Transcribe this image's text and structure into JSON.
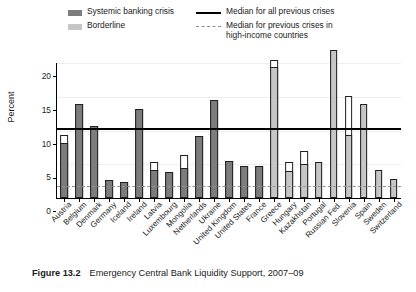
{
  "legend": {
    "systemic": {
      "label": "Systemic banking crisis",
      "color": "#7c7c7c",
      "icon": "legend-swatch"
    },
    "borderline": {
      "label": "Borderline",
      "color": "#c6c6c6",
      "icon": "legend-swatch"
    },
    "median_all": {
      "label": "Median for all previous crises",
      "color": "#000000",
      "icon": "legend-solid-line"
    },
    "median_high_income": {
      "label": "Median for previous crises in\nhigh-income countries",
      "color": "#949494",
      "icon": "legend-dashed-line"
    }
  },
  "caption": {
    "figure_number": "Figure 13.2",
    "title": "Emergency Central Bank Liquidity Support, 2007–09"
  },
  "chart_data": {
    "type": "bar",
    "title": "Emergency Central Bank Liquidity Support, 2007–09",
    "xlabel": "",
    "ylabel": "Percent",
    "ylim": [
      0,
      20
    ],
    "yticks": [
      0,
      5,
      10,
      15,
      20
    ],
    "ytick_labels": [
      "0",
      "5",
      "10",
      "15",
      "20"
    ],
    "grid": true,
    "legend_position": "top",
    "categories": [
      "Austria",
      "Belgium",
      "Denmark",
      "Germany",
      "Iceland",
      "Ireland",
      "Latvia",
      "Luxembourg",
      "Mongolia",
      "Netherlands",
      "Ukraine",
      "United Kingdom",
      "United States",
      "France",
      "Greece",
      "Hungary",
      "Kazakhstan",
      "Portugal",
      "Russian Fed.",
      "Slovenia",
      "Spain",
      "Sweden",
      "Switzerland"
    ],
    "series": [
      {
        "name": "Systemic banking crisis",
        "color": "#7c7c7c",
        "values": [
          8.2,
          14.0,
          10.6,
          2.7,
          2.4,
          13.2,
          4.1,
          3.9,
          4.4,
          9.2,
          14.5,
          5.5,
          4.8,
          4.7,
          null,
          null,
          null,
          null,
          null,
          null,
          null,
          null,
          null
        ]
      },
      {
        "name": "Borderline",
        "color": "#c6c6c6",
        "values": [
          null,
          null,
          null,
          null,
          null,
          null,
          null,
          null,
          null,
          null,
          null,
          null,
          null,
          null,
          19.4,
          4.0,
          5.1,
          5.4,
          22.0,
          9.3,
          13.9,
          4.1,
          2.8
        ]
      },
      {
        "name": "Upper (white) segment top",
        "color": "#ffffff",
        "values": [
          9.3,
          14.0,
          10.6,
          2.7,
          2.4,
          13.2,
          5.4,
          3.9,
          6.3,
          9.2,
          14.5,
          5.5,
          4.8,
          4.7,
          20.4,
          5.4,
          7.0,
          5.4,
          22.0,
          15.1,
          13.9,
          4.1,
          2.8
        ]
      }
    ],
    "reference_lines": [
      {
        "name": "Median for all previous crises",
        "value": 10.4,
        "style": "solid",
        "color": "#000000"
      },
      {
        "name": "Median for previous crises in high-income countries",
        "value": 1.8,
        "style": "dashed",
        "color": "#949494"
      }
    ]
  }
}
